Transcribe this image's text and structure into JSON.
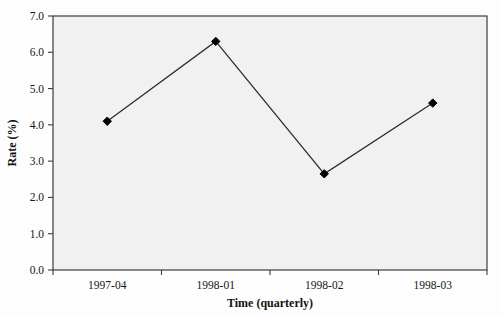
{
  "chart_data": {
    "type": "line",
    "title": "",
    "subtitle": "",
    "xlabel": "Time (quarterly)",
    "ylabel": "Rate (%)",
    "categories": [
      "1997-04",
      "1998-01",
      "1998-02",
      "1998-03"
    ],
    "values": [
      4.1,
      6.3,
      2.65,
      4.6
    ],
    "series": [
      {
        "name": "Rate",
        "values": [
          4.1,
          6.3,
          2.65,
          4.6
        ],
        "marker": "diamond",
        "marker_color": "#000000",
        "line_color": "#2b2b2b"
      }
    ],
    "ylim": [
      0.0,
      7.0
    ],
    "ytick_labels": [
      "0.0",
      "1.0",
      "2.0",
      "3.0",
      "4.0",
      "5.0",
      "6.0",
      "7.0"
    ],
    "ytick_values": [
      0.0,
      1.0,
      2.0,
      3.0,
      4.0,
      5.0,
      6.0,
      7.0
    ],
    "xtick_labels": [
      "1997-04",
      "1998-01",
      "1998-02",
      "1998-03"
    ],
    "grid": false,
    "legend": false,
    "legend_position": "none",
    "plot_background": "#f1f1f1",
    "frame_color": "#3d3d3d",
    "annotations": []
  }
}
